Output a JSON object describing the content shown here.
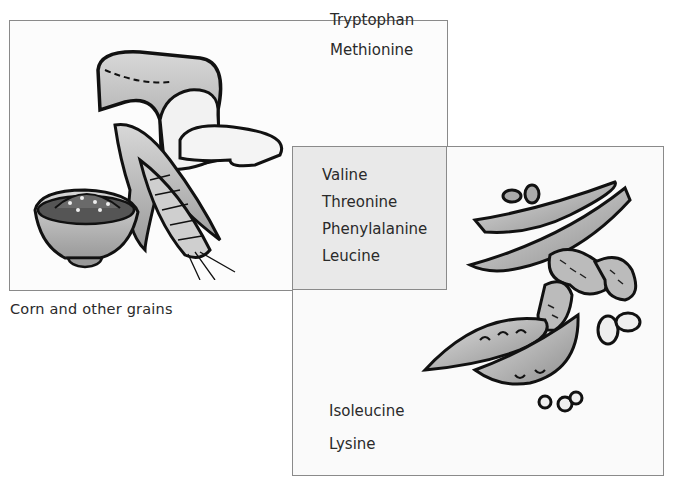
{
  "diagram": {
    "type": "venn-overlap",
    "sets": [
      {
        "name": "grains",
        "caption": "Corn and other grains",
        "illustration": [
          "bread-loaf",
          "bread-slice",
          "corn-cob",
          "grain-bowl"
        ],
        "exclusive_amino_acids": [
          "Tryptophan",
          "Methionine"
        ]
      },
      {
        "name": "legumes",
        "illustration": [
          "bean-pods",
          "peanuts",
          "peas",
          "beans"
        ],
        "exclusive_amino_acids": [
          "Isoleucine",
          "Lysine"
        ]
      }
    ],
    "shared_amino_acids": [
      "Valine",
      "Threonine",
      "Phenylalanine",
      "Leucine"
    ]
  },
  "labels": {
    "grains_only": [
      "Tryptophan",
      "Methionine"
    ],
    "shared": [
      "Valine",
      "Threonine",
      "Phenylalanine",
      "Leucine"
    ],
    "legumes_only": [
      "Isoleucine",
      "Lysine"
    ],
    "caption": "Corn and other grains"
  }
}
